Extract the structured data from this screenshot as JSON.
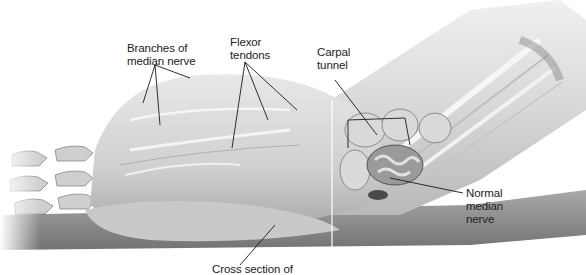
{
  "figure": {
    "colors": {
      "background": "#ffffff",
      "tissue_light": "#e4e4e4",
      "tissue_mid": "#c8c8c8",
      "tissue_dark": "#8a8a8a",
      "leader_line": "#1a1a1a",
      "label_text": "#222222"
    }
  },
  "labels": {
    "branches": {
      "line1": "Branches of",
      "line2": "median nerve"
    },
    "flexor": {
      "line1": "Flexor",
      "line2": "tendons"
    },
    "carpal": {
      "line1": "Carpal",
      "line2": "tunnel"
    },
    "normal": {
      "line1": "Normal",
      "line2": "median",
      "line3": "nerve"
    },
    "cross": {
      "line1": "Cross section of"
    }
  }
}
